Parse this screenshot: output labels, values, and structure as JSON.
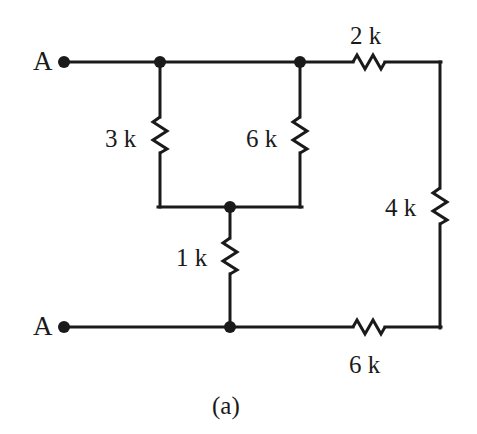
{
  "figure": {
    "caption": "(a)",
    "type": "resistor-network-schematic",
    "colors": {
      "background": "#ffffff",
      "wire": "#1a1a1a",
      "label": "#1a1a1a"
    }
  },
  "terminals": [
    {
      "id": "terminal-top",
      "label": "A",
      "x": 64,
      "y": 62
    },
    {
      "id": "terminal-bottom",
      "label": "A",
      "x": 64,
      "y": 327
    }
  ],
  "nodes": [
    {
      "id": "node-top-left",
      "x": 160,
      "y": 62
    },
    {
      "id": "node-top-mid",
      "x": 300,
      "y": 62
    },
    {
      "id": "node-middle",
      "x": 230,
      "y": 207
    },
    {
      "id": "node-bottom",
      "x": 230,
      "y": 327
    }
  ],
  "resistors": [
    {
      "id": "resistor-3k",
      "label": "3 k",
      "value": 3,
      "unit": "k",
      "orientation": "vertical",
      "x": 160,
      "y": 135,
      "label_x": 105,
      "label_y": 126
    },
    {
      "id": "resistor-6k-upper",
      "label": "6 k",
      "value": 6,
      "unit": "k",
      "orientation": "vertical",
      "x": 300,
      "y": 135,
      "label_x": 246,
      "label_y": 126
    },
    {
      "id": "resistor-1k",
      "label": "1 k",
      "value": 1,
      "unit": "k",
      "orientation": "vertical",
      "x": 230,
      "y": 256,
      "label_x": 176,
      "label_y": 245
    },
    {
      "id": "resistor-2k",
      "label": "2 k",
      "value": 2,
      "unit": "k",
      "orientation": "horizontal",
      "x": 369,
      "y": 62,
      "label_x": 350,
      "label_y": 23
    },
    {
      "id": "resistor-4k",
      "label": "4 k",
      "value": 4,
      "unit": "k",
      "orientation": "vertical",
      "x": 440,
      "y": 206,
      "label_x": 385,
      "label_y": 195
    },
    {
      "id": "resistor-6k-lower",
      "label": "6 k",
      "value": 6,
      "unit": "k",
      "orientation": "horizontal",
      "x": 369,
      "y": 327,
      "label_x": 349,
      "label_y": 352
    }
  ],
  "caption": {
    "text": "(a)",
    "x": 212,
    "y": 393
  }
}
